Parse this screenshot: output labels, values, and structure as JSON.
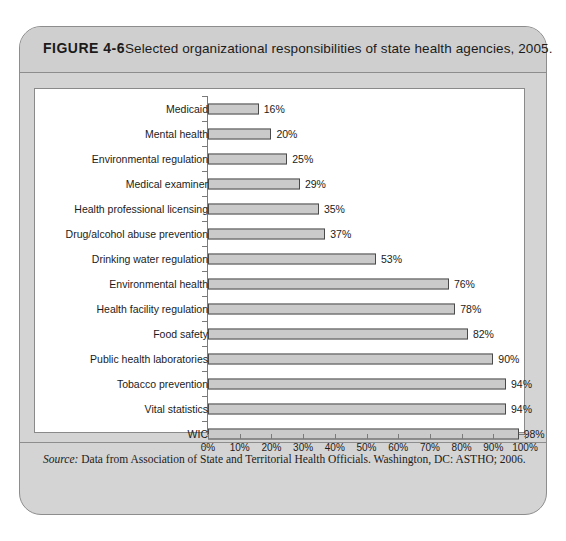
{
  "figure": {
    "label": "FIGURE 4-6",
    "title": "Selected organizational responsibilities of state health agencies, 2005.",
    "source_prefix": "Source:",
    "source_text": " Data from Association of State and Territorial Health Officials. Washington, DC: ASTHO; 2006."
  },
  "colors": {
    "frame_background": "#d4d4d4",
    "header_background": "#cfcfcf",
    "frame_border": "#8d8d8d",
    "plot_background": "#ffffff",
    "plot_border": "#8a8a8a",
    "bar_fill": "#cacaca",
    "bar_border": "#4a4a4a",
    "axis": "#7a7a7a",
    "text": "#1b1b1b"
  },
  "chart_data": {
    "type": "bar",
    "orientation": "horizontal",
    "title": "Selected organizational responsibilities of state health agencies, 2005.",
    "xlabel": "",
    "ylabel": "",
    "xlim": [
      0,
      100
    ],
    "grid": false,
    "legend": false,
    "value_suffix": "%",
    "xticks": [
      0,
      10,
      20,
      30,
      40,
      50,
      60,
      70,
      80,
      90,
      100
    ],
    "xtick_labels": [
      "0%",
      "10%",
      "20%",
      "30%",
      "40%",
      "50%",
      "60%",
      "70%",
      "80%",
      "90%",
      "100%"
    ],
    "categories": [
      "Medicaid",
      "Mental health",
      "Environmental regulation",
      "Medical examiner",
      "Health professional licensing",
      "Drug/alcohol abuse prevention",
      "Drinking water regulation",
      "Environmental health",
      "Health facility regulation",
      "Food safety",
      "Public health laboratories",
      "Tobacco prevention",
      "Vital statistics",
      "WIC"
    ],
    "values": [
      16,
      20,
      25,
      29,
      35,
      37,
      53,
      76,
      78,
      82,
      90,
      94,
      94,
      98
    ],
    "data_labels": [
      "16%",
      "20%",
      "25%",
      "29%",
      "35%",
      "37%",
      "53%",
      "76%",
      "78%",
      "82%",
      "90%",
      "94%",
      "94%",
      "98%"
    ]
  }
}
